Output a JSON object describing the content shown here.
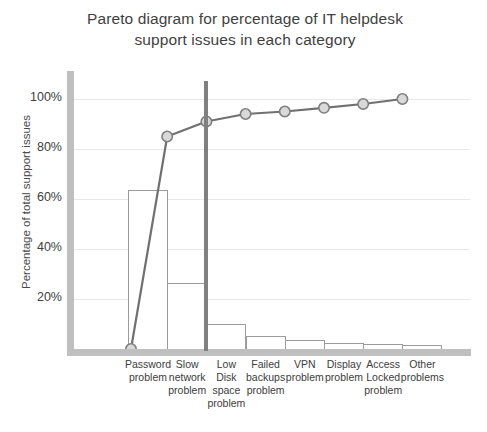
{
  "chart_data": {
    "type": "bar",
    "title": "Pareto diagram for percentage of IT helpdesk\nsupport issues in each category",
    "xlabel": "",
    "ylabel": "Percentage of total support issues",
    "ylim": [
      0,
      104
    ],
    "grid": true,
    "legend_position": "none",
    "categories": [
      "Password\nproblem",
      "Slow\nnetwork\nproblem",
      "Low\nDisk\nspace\nproblem",
      "Failed\nbackups\nproblem",
      "VPN\nproblem",
      "Display\nproblem",
      "Access\nLocked\nproblem",
      "Other\nproblems"
    ],
    "ytick_labels": [
      "100%",
      "80%",
      "60%",
      "40%",
      "20%"
    ],
    "ytick_values": [
      100,
      80,
      60,
      40,
      20
    ],
    "series": [
      {
        "name": "Percentage of total support issues",
        "type": "bar",
        "values": [
          64,
          27,
          10.5,
          5.5,
          4,
          3,
          2.5,
          2
        ]
      },
      {
        "name": "Cumulative percentage",
        "type": "line",
        "values": [
          0,
          85,
          91,
          94,
          95,
          96.5,
          98,
          100
        ],
        "marker": "circle"
      }
    ],
    "annotations": [
      {
        "name": "pareto-cutoff-divider",
        "type": "vertical-line",
        "after_category_index": 1
      }
    ],
    "colors": {
      "bar_fill": "#ffffff",
      "bar_stroke": "#9b9b9b",
      "line": "#707070",
      "marker_fill": "#d9d9d9",
      "marker_stroke": "#7f7f7f",
      "axis": "#bfbfbf",
      "grid": "#e8e8e8",
      "cutoff": "#808080",
      "text": "#404040",
      "background": "#ffffff"
    }
  }
}
